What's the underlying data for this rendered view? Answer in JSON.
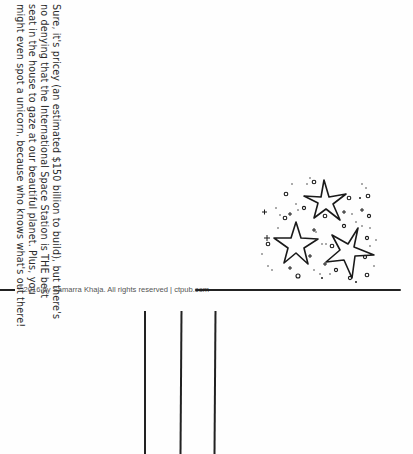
{
  "page": {
    "handwritten_text": {
      "lines": [
        "Sure, it's pricey (an estimated $150 billion to build), but there's",
        "no denying that the International Space Station is THE best",
        "seat in the house to gaze at our beautiful planet. Plus, you",
        "might even spot a unicorn, because who knows what's out there!"
      ]
    },
    "illustration": {
      "subject": "cluster of three hand-drawn stars with sparkles and dots"
    },
    "footer": {
      "copyright": "©2016 by Samarra Khaja. All rights reserved | ctpub.com"
    },
    "lines": {
      "count": 3,
      "color": "#222222"
    }
  }
}
